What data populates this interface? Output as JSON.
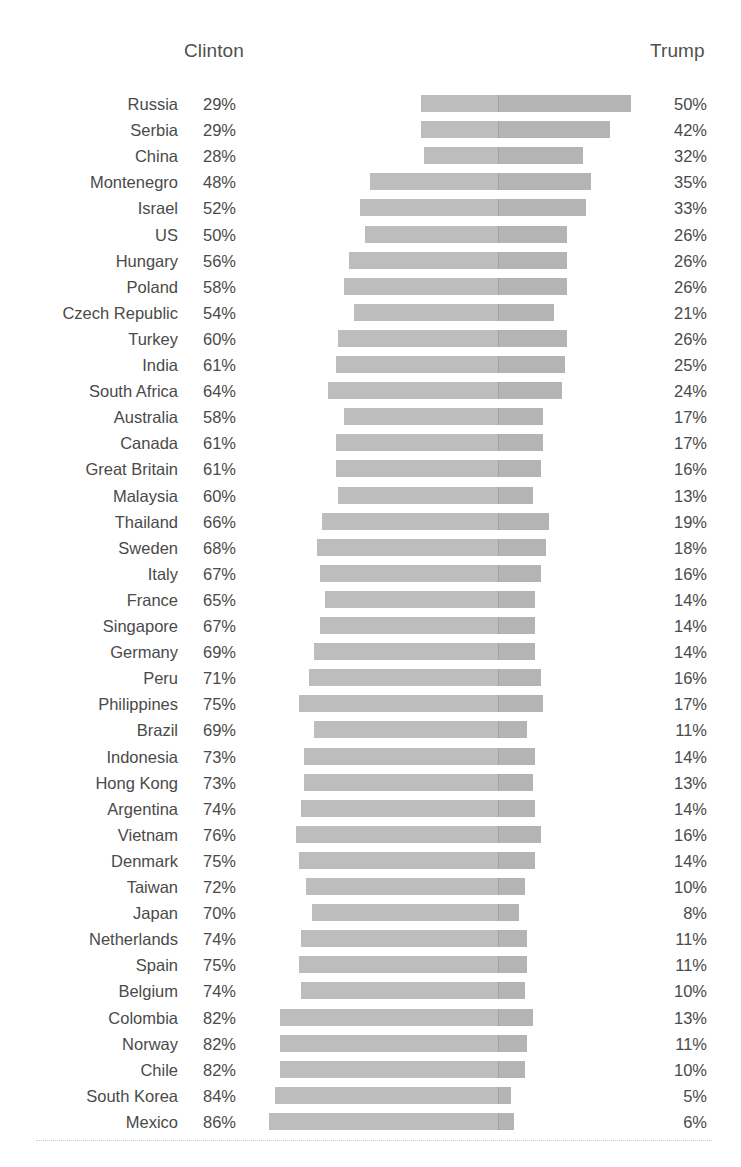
{
  "chart": {
    "type": "diverging-bar",
    "left_header": "Clinton",
    "right_header": "Trump"
  },
  "chart_data": {
    "type": "bar",
    "title": "",
    "subtitle": "",
    "xlabel": "",
    "ylabel": "",
    "orientation": "horizontal",
    "layout": "diverging",
    "grid": false,
    "legend_position": "top",
    "axis_center_percent": 0,
    "bar_color_left": "#bdbdbd",
    "bar_color_right": "#b4b4b4",
    "px_per_percent": 2.66,
    "center_x_px": 498,
    "series": [
      {
        "name": "Clinton",
        "direction": "left",
        "unit": "%"
      },
      {
        "name": "Trump",
        "direction": "right",
        "unit": "%"
      }
    ],
    "categories": [
      "Russia",
      "Serbia",
      "China",
      "Montenegro",
      "Israel",
      "US",
      "Hungary",
      "Poland",
      "Czech Republic",
      "Turkey",
      "India",
      "South Africa",
      "Australia",
      "Canada",
      "Great Britain",
      "Malaysia",
      "Thailand",
      "Sweden",
      "Italy",
      "France",
      "Singapore",
      "Germany",
      "Peru",
      "Philippines",
      "Brazil",
      "Indonesia",
      "Hong Kong",
      "Argentina",
      "Vietnam",
      "Denmark",
      "Taiwan",
      "Japan",
      "Netherlands",
      "Spain",
      "Belgium",
      "Colombia",
      "Norway",
      "Chile",
      "South Korea",
      "Mexico"
    ],
    "clinton_values": [
      29,
      29,
      28,
      48,
      52,
      50,
      56,
      58,
      54,
      60,
      61,
      64,
      58,
      61,
      61,
      60,
      66,
      68,
      67,
      65,
      67,
      69,
      71,
      75,
      69,
      73,
      73,
      74,
      76,
      75,
      72,
      70,
      74,
      75,
      74,
      82,
      82,
      82,
      84,
      86
    ],
    "trump_values": [
      50,
      42,
      32,
      35,
      33,
      26,
      26,
      26,
      21,
      26,
      25,
      24,
      17,
      17,
      16,
      13,
      19,
      18,
      16,
      14,
      14,
      14,
      16,
      17,
      11,
      14,
      13,
      14,
      16,
      14,
      10,
      8,
      11,
      11,
      10,
      13,
      11,
      10,
      5,
      6
    ]
  },
  "rows": [
    {
      "country": "Russia",
      "clinton": "29%",
      "trump": "50%"
    },
    {
      "country": "Serbia",
      "clinton": "29%",
      "trump": "42%"
    },
    {
      "country": "China",
      "clinton": "28%",
      "trump": "32%"
    },
    {
      "country": "Montenegro",
      "clinton": "48%",
      "trump": "35%"
    },
    {
      "country": "Israel",
      "clinton": "52%",
      "trump": "33%"
    },
    {
      "country": "US",
      "clinton": "50%",
      "trump": "26%"
    },
    {
      "country": "Hungary",
      "clinton": "56%",
      "trump": "26%"
    },
    {
      "country": "Poland",
      "clinton": "58%",
      "trump": "26%"
    },
    {
      "country": "Czech Republic",
      "clinton": "54%",
      "trump": "21%"
    },
    {
      "country": "Turkey",
      "clinton": "60%",
      "trump": "26%"
    },
    {
      "country": "India",
      "clinton": "61%",
      "trump": "25%"
    },
    {
      "country": "South Africa",
      "clinton": "64%",
      "trump": "24%"
    },
    {
      "country": "Australia",
      "clinton": "58%",
      "trump": "17%"
    },
    {
      "country": "Canada",
      "clinton": "61%",
      "trump": "17%"
    },
    {
      "country": "Great Britain",
      "clinton": "61%",
      "trump": "16%"
    },
    {
      "country": "Malaysia",
      "clinton": "60%",
      "trump": "13%"
    },
    {
      "country": "Thailand",
      "clinton": "66%",
      "trump": "19%"
    },
    {
      "country": "Sweden",
      "clinton": "68%",
      "trump": "18%"
    },
    {
      "country": "Italy",
      "clinton": "67%",
      "trump": "16%"
    },
    {
      "country": "France",
      "clinton": "65%",
      "trump": "14%"
    },
    {
      "country": "Singapore",
      "clinton": "67%",
      "trump": "14%"
    },
    {
      "country": "Germany",
      "clinton": "69%",
      "trump": "14%"
    },
    {
      "country": "Peru",
      "clinton": "71%",
      "trump": "16%"
    },
    {
      "country": "Philippines",
      "clinton": "75%",
      "trump": "17%"
    },
    {
      "country": "Brazil",
      "clinton": "69%",
      "trump": "11%"
    },
    {
      "country": "Indonesia",
      "clinton": "73%",
      "trump": "14%"
    },
    {
      "country": "Hong Kong",
      "clinton": "73%",
      "trump": "13%"
    },
    {
      "country": "Argentina",
      "clinton": "74%",
      "trump": "14%"
    },
    {
      "country": "Vietnam",
      "clinton": "76%",
      "trump": "16%"
    },
    {
      "country": "Denmark",
      "clinton": "75%",
      "trump": "14%"
    },
    {
      "country": "Taiwan",
      "clinton": "72%",
      "trump": "10%"
    },
    {
      "country": "Japan",
      "clinton": "70%",
      "trump": "8%"
    },
    {
      "country": "Netherlands",
      "clinton": "74%",
      "trump": "11%"
    },
    {
      "country": "Spain",
      "clinton": "75%",
      "trump": "11%"
    },
    {
      "country": "Belgium",
      "clinton": "74%",
      "trump": "10%"
    },
    {
      "country": "Colombia",
      "clinton": "82%",
      "trump": "13%"
    },
    {
      "country": "Norway",
      "clinton": "82%",
      "trump": "11%"
    },
    {
      "country": "Chile",
      "clinton": "82%",
      "trump": "10%"
    },
    {
      "country": "South Korea",
      "clinton": "84%",
      "trump": "5%"
    },
    {
      "country": "Mexico",
      "clinton": "86%",
      "trump": "6%"
    }
  ]
}
